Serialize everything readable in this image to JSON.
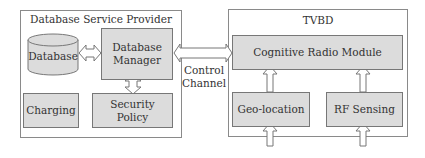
{
  "provider": {
    "title": "Database Service Provider",
    "database": "Database",
    "manager": "Database Manager",
    "manager_lines": [
      "Database",
      "Manager"
    ],
    "charging": "Charging",
    "security_policy": "Security Policy"
  },
  "link": {
    "label_lines": [
      "Control",
      "Channel"
    ]
  },
  "tvbd": {
    "title": "TVBD",
    "cognitive_radio": "Cognitive Radio Module",
    "geo_location": "Geo-location",
    "rf_sensing": "RF Sensing"
  },
  "colors": {
    "box_fill": "#dcdcdc",
    "border": "#777777",
    "text": "#333333"
  }
}
